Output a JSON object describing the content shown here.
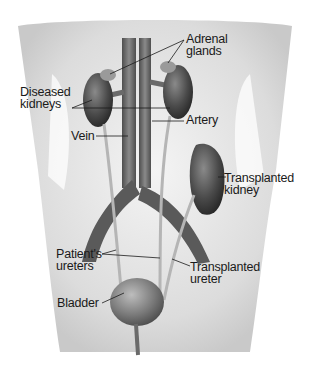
{
  "figure": {
    "labels": {
      "adrenal_glands": "Adrenal\nglands",
      "diseased_kidneys": "Diseased\nkidneys",
      "artery": "Artery",
      "vein": "Vein",
      "transplanted_kidney": "Transplanted\nkidney",
      "patients_ureters": "Patient's\nureters",
      "transplanted_ureter": "Transplanted\nureter",
      "bladder": "Bladder"
    },
    "colors": {
      "background": "#ffffff",
      "body_skin": "#e6e6e6",
      "organ_dark": "#3a3a3a",
      "vessel": "#6e6e6e",
      "ureter": "#b5b5b5",
      "leader_line": "#1a1a1a"
    }
  }
}
